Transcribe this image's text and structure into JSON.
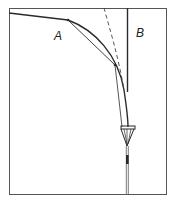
{
  "diagram": {
    "labels": {
      "a": "A",
      "b": "B"
    },
    "colors": {
      "line": "#2a2a2a",
      "frame": "#555555",
      "background": "#ffffff"
    },
    "elements": [
      "frame",
      "sloped-line-to-A",
      "curved-path-A",
      "straight-chord-A",
      "dashed-guide-line",
      "vertical-wall-B",
      "rod-lower",
      "cone-cup"
    ]
  }
}
